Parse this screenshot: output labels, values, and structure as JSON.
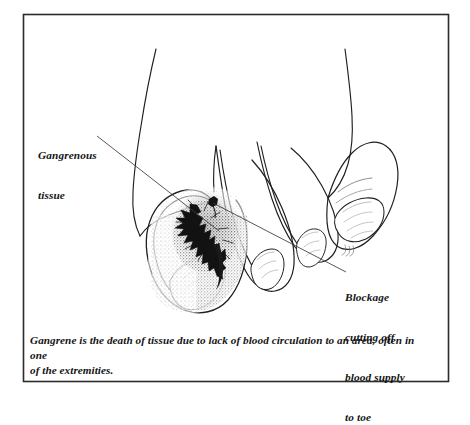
{
  "figure": {
    "frame_color": "#2b2b2b",
    "background_color": "#ffffff",
    "ink_color": "#1a1a1a",
    "lesion_color": "#101010"
  },
  "labels": {
    "gangrenous": {
      "name": "gangrenous-tissue-label",
      "line1": "Gangrenous",
      "line2": "tissue"
    },
    "blockage": {
      "name": "blockage-label",
      "line1": "Blockage",
      "line2": "cutting off",
      "line3": "blood supply",
      "line4": "to toe"
    }
  },
  "caption": {
    "line1": "Gangrene is the death of tissue due to lack of blood circulation to an area, often in one",
    "line2": "of the extremities."
  },
  "illustration": {
    "subject": "foot-with-gangrenous-big-toe",
    "parts": [
      "foot-dorsum",
      "big-toe",
      "big-toenail",
      "second-toe",
      "third-toe",
      "fourth-toe",
      "gangrene-lesion",
      "leader-line-gangrenous",
      "leader-line-blockage"
    ]
  }
}
